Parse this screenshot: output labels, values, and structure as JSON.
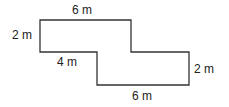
{
  "figure": {
    "type": "composite rectilinear shape",
    "stroke_color": "#333333",
    "labels": {
      "top": "6 m",
      "left": "2 m",
      "inner_bottom_left": "4 m",
      "right": "2 m",
      "bottom": "6 m"
    },
    "vertices": [
      [
        40,
        20
      ],
      [
        131,
        20
      ],
      [
        131,
        52
      ],
      [
        189,
        52
      ],
      [
        189,
        85
      ],
      [
        97,
        85
      ],
      [
        97,
        52
      ],
      [
        40,
        52
      ]
    ]
  }
}
